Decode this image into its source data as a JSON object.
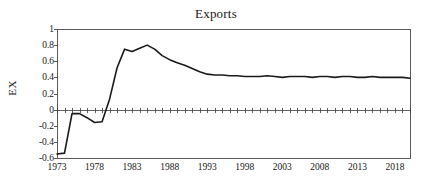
{
  "chart_data": {
    "type": "line",
    "title": "Exports",
    "xlabel": "",
    "ylabel": "EX",
    "xlim": [
      1973,
      2020
    ],
    "ylim": [
      -0.6,
      1.0
    ],
    "yticks": [
      1,
      0.8,
      0.6,
      0.4,
      0.2,
      0,
      -0.2,
      -0.4,
      -0.6
    ],
    "ytick_labels": [
      "1",
      "0.8",
      "0.6",
      "0.4",
      "0.2",
      "0",
      "-0.2",
      "-0.4",
      "-0.6"
    ],
    "xticks": [
      1973,
      1978,
      1983,
      1988,
      1993,
      1998,
      2003,
      2008,
      2013,
      2018
    ],
    "xtick_labels": [
      "1973",
      "1978",
      "1983",
      "1988",
      "1993",
      "1998",
      "2003",
      "2008",
      "2013",
      "2018"
    ],
    "grid": false,
    "legend": "none",
    "zero_line": true,
    "zero_line_ticks": true,
    "series": [
      {
        "name": "EX",
        "color": "#1a1a1a",
        "x": [
          1973,
          1974,
          1975,
          1976,
          1977,
          1978,
          1979,
          1980,
          1981,
          1982,
          1983,
          1984,
          1985,
          1986,
          1987,
          1988,
          1989,
          1990,
          1991,
          1992,
          1993,
          1994,
          1995,
          1996,
          1997,
          1998,
          1999,
          2000,
          2001,
          2002,
          2003,
          2004,
          2005,
          2006,
          2007,
          2008,
          2009,
          2010,
          2011,
          2012,
          2013,
          2014,
          2015,
          2016,
          2017,
          2018,
          2019,
          2020
        ],
        "values": [
          -0.55,
          -0.54,
          -0.05,
          -0.05,
          -0.1,
          -0.16,
          -0.15,
          0.13,
          0.52,
          0.75,
          0.72,
          0.76,
          0.8,
          0.75,
          0.67,
          0.62,
          0.58,
          0.55,
          0.51,
          0.47,
          0.44,
          0.43,
          0.43,
          0.42,
          0.42,
          0.41,
          0.41,
          0.41,
          0.42,
          0.41,
          0.4,
          0.41,
          0.41,
          0.41,
          0.4,
          0.41,
          0.41,
          0.4,
          0.41,
          0.41,
          0.4,
          0.4,
          0.41,
          0.4,
          0.4,
          0.4,
          0.4,
          0.39
        ]
      }
    ]
  },
  "axes": {
    "frame_color": "#5a5a5a",
    "line_color": "#1a1a1a"
  }
}
